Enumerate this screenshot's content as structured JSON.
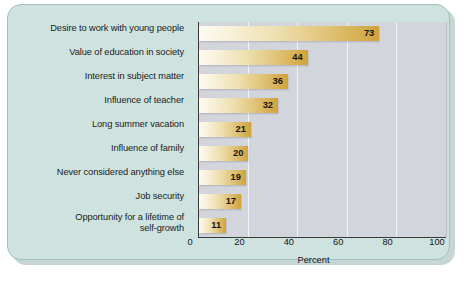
{
  "chart_data": {
    "type": "bar",
    "orientation": "horizontal",
    "title": "",
    "xlabel": "Percent",
    "ylabel": "",
    "xlim": [
      0,
      100
    ],
    "xticks": [
      0,
      20,
      40,
      60,
      80,
      100
    ],
    "grid": "vertical white gridlines at 20, 40, 60, 80",
    "legend": "none",
    "categories": [
      "Desire to work with young people",
      "Value of education in society",
      "Interest in subject matter",
      "Influence of teacher",
      "Long summer vacation",
      "Influence of family",
      "Never considered anything else",
      "Job security",
      "Opportunity for a lifetime of self-growth"
    ],
    "values": [
      73,
      44,
      36,
      32,
      21,
      20,
      19,
      17,
      11
    ],
    "value_labels": [
      "73",
      "44",
      "36",
      "32",
      "21",
      "20",
      "19",
      "17",
      "11"
    ],
    "bars": [
      {
        "label": "Desire to work with young people",
        "label_line1": "Desire to work with young people",
        "label_line2": "",
        "value": 73,
        "value_text": "73"
      },
      {
        "label": "Value of education in society",
        "label_line1": "Value of education in society",
        "label_line2": "",
        "value": 44,
        "value_text": "44"
      },
      {
        "label": "Interest in subject matter",
        "label_line1": "Interest in subject matter",
        "label_line2": "",
        "value": 36,
        "value_text": "36"
      },
      {
        "label": "Influence of teacher",
        "label_line1": "Influence of teacher",
        "label_line2": "",
        "value": 32,
        "value_text": "32"
      },
      {
        "label": "Long summer vacation",
        "label_line1": "Long summer vacation",
        "label_line2": "",
        "value": 21,
        "value_text": "21"
      },
      {
        "label": "Influence of family",
        "label_line1": "Influence of family",
        "label_line2": "",
        "value": 20,
        "value_text": "20"
      },
      {
        "label": "Never considered anything else",
        "label_line1": "Never considered anything else",
        "label_line2": "",
        "value": 19,
        "value_text": "19"
      },
      {
        "label": "Job security",
        "label_line1": "Job security",
        "label_line2": "",
        "value": 17,
        "value_text": "17"
      },
      {
        "label": "Opportunity for a lifetime of self-growth",
        "label_line1": "Opportunity for a lifetime of",
        "label_line2": "self-growth",
        "value": 11,
        "value_text": "11"
      }
    ],
    "xtick_labels": [
      "0",
      "20",
      "40",
      "60",
      "80",
      "100"
    ]
  },
  "colors": {
    "panel_background": "#cee3df",
    "panel_border": "#9dc2bd",
    "plot_background": "#d3d5dd",
    "gridline": "#f2f3f6",
    "bar_gradient_start": "#fdfaf0",
    "bar_gradient_end": "#cfa33a",
    "axis_line": "#3a3a3a",
    "text": "#151515"
  }
}
